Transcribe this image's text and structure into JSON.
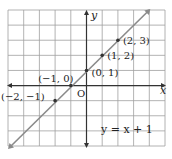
{
  "chart_data": {
    "type": "line",
    "title": "",
    "equation": "y = x + 1",
    "xlabel": "x",
    "ylabel": "y",
    "origin_label": "O",
    "xlim": [
      -5,
      5
    ],
    "ylim": [
      -4,
      5
    ],
    "grid": true,
    "grid_step": 1,
    "line": {
      "slope": 1,
      "intercept": 1,
      "x_range": [
        -5,
        4
      ],
      "color": "#888888"
    },
    "points": [
      {
        "x": -2,
        "y": -1,
        "label": "(−2, −1)"
      },
      {
        "x": -1,
        "y": 0,
        "label": "(−1, 0)"
      },
      {
        "x": 0,
        "y": 1,
        "label": "(0, 1)"
      },
      {
        "x": 1,
        "y": 2,
        "label": "(1, 2)"
      },
      {
        "x": 2,
        "y": 3,
        "label": "(2, 3)"
      }
    ],
    "colors": {
      "grid": "#a0a0a0",
      "axis": "#333333",
      "line": "#8a8a8a",
      "point": "#333333",
      "text": "#222222"
    }
  }
}
